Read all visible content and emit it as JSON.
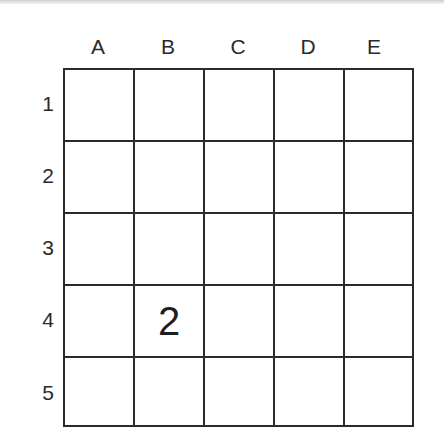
{
  "puzzle": {
    "columns": [
      "A",
      "B",
      "C",
      "D",
      "E"
    ],
    "rows": [
      "1",
      "2",
      "3",
      "4",
      "5"
    ],
    "cells": [
      [
        "",
        "",
        "",
        "",
        ""
      ],
      [
        "",
        "",
        "",
        "",
        ""
      ],
      [
        "",
        "",
        "",
        "",
        ""
      ],
      [
        "",
        "2",
        "",
        "",
        ""
      ],
      [
        "",
        "",
        "",
        "",
        ""
      ]
    ]
  }
}
